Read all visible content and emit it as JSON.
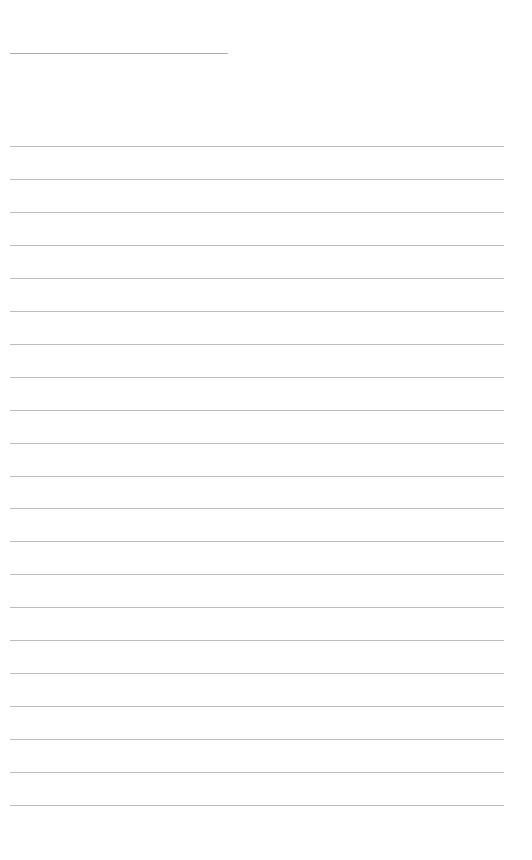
{
  "page": {
    "type": "blank-ruled-sheet",
    "header_line": {
      "visible": true
    },
    "ruled_lines": {
      "count": 21,
      "first_y": 146,
      "spacing": 32.95
    },
    "colors": {
      "paper": "#ffffff",
      "line": "#a8a8a8"
    }
  }
}
